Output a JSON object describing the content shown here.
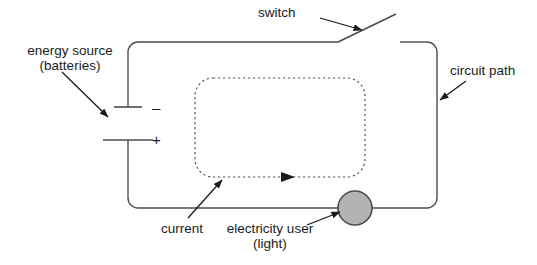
{
  "diagram": {
    "background_color": "#ffffff",
    "line_color": "#4d4d4d",
    "text_color": "#1a1a1a",
    "lamp_fill_color": "#b3b3b3",
    "lamp_stroke_color": "#4d4d4d",
    "labels": {
      "energy_source": "energy source\n(batteries)",
      "switch": "switch",
      "circuit_path": "circuit path",
      "current": "current",
      "electricity_user": "electricity user\n(light)"
    },
    "battery": {
      "negative_sign": "–",
      "positive_sign": "+"
    },
    "components": [
      {
        "name": "battery",
        "label": "energy source (batteries)"
      },
      {
        "name": "switch",
        "label": "switch",
        "state": "open"
      },
      {
        "name": "lamp",
        "label": "electricity user (light)"
      },
      {
        "name": "wire-loop",
        "label": "circuit path"
      },
      {
        "name": "current-flow",
        "label": "current",
        "direction": "clockwise"
      }
    ]
  }
}
